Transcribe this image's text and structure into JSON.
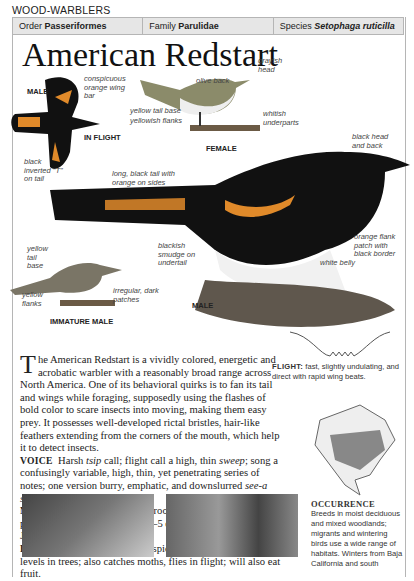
{
  "section": "WOOD-WARBLERS",
  "taxonomy": {
    "order_label": "Order",
    "order_value": "Passeriformes",
    "family_label": "Family",
    "family_value": "Parulidae",
    "species_label": "Species",
    "species_value": "Setophaga ruticilla"
  },
  "title": "American Redstart",
  "illustrations": {
    "flight": {
      "sex": "MALE",
      "caption": "IN FLIGHT",
      "labels": [
        "conspicuous orange wing bar",
        "black inverted \"T\" on tail"
      ]
    },
    "female": {
      "caption": "FEMALE",
      "labels": [
        "grayish head",
        "olive back",
        "yellow tail base",
        "yellowish flanks",
        "whitish underparts"
      ]
    },
    "male": {
      "caption": "MALE",
      "labels": [
        "black head and back",
        "long, black tail with orange on sides",
        "blackish smudge on undertail",
        "orange flank patch with black border",
        "white belly"
      ]
    },
    "immature": {
      "caption": "IMMATURE MALE",
      "labels": [
        "yellow tail base",
        "yellow flanks",
        "irregular, dark patches"
      ]
    }
  },
  "description": {
    "dropcap": "T",
    "intro": "he American Redstart is a vividly colored, energetic and acrobatic warbler with a reasonably broad range across North America. One of its behavioral quirks is to fan its tail and wings while foraging, supposedly using the flashes of bold color to scare insects into moving, making them easy prey. It possesses well-developed rictal bristles, hair-like feathers extending from the corners of the mouth, which help it to detect insects.",
    "voice_label": "VOICE",
    "voice_1": "Harsh ",
    "voice_tsip": "tsip",
    "voice_2": " call; flight call a high, thin ",
    "voice_sweep": "sweep",
    "voice_3": "; song a confusingly variable, high, thin, yet penetrating series of notes; one version burry, emphatic, and downslurred ",
    "voice_song": "see-a see-a see-a see-a ZEE-urrr.",
    "nesting_label": "NESTING",
    "nesting": "Cup of grasses and rootlets, lined with feathers; placed low in deciduous tree; 2–5 eggs; 1–2 broods; May–July.",
    "feeding_label": "FEEDING",
    "feeding": "Gleans insects and spiders from leaves at mid-levels in trees; also catches moths, flies in flight; will also eat fruit."
  },
  "flight": {
    "label": "FLIGHT:",
    "text": "fast, slightly undulating, and direct with rapid wing beats."
  },
  "occurrence": {
    "label": "OCCURRENCE",
    "text": "Breeds in moist deciduous and mixed woodlands; migrants and wintering birds use a wide range of habitats. Winters from Baja California and south"
  }
}
